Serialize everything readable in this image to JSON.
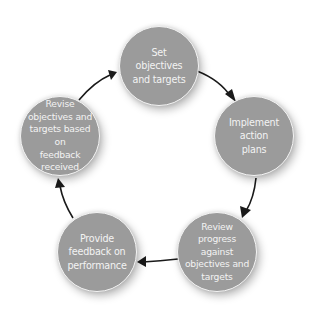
{
  "diagram": {
    "type": "cycle",
    "colors": {
      "node_fill": "#9b9b9b",
      "node_border": "#f4f4f4",
      "node_text": "#f3f3f3",
      "arrow": "#1a1a1a",
      "background": "#ffffff"
    },
    "nodes": [
      {
        "id": "set",
        "label": "Set\nobjectives\nand targets"
      },
      {
        "id": "implement",
        "label": "Implement\naction\nplans"
      },
      {
        "id": "review",
        "label": "Review\nprogress\nagainst\nobjectives and\ntargets"
      },
      {
        "id": "feedback",
        "label": "Provide\nfeedback on\nperformance"
      },
      {
        "id": "revise",
        "label": "Revise\nobjectives and\ntargets based on\nfeedback\nreceived"
      }
    ],
    "edges": [
      {
        "from": "set",
        "to": "implement"
      },
      {
        "from": "implement",
        "to": "review"
      },
      {
        "from": "review",
        "to": "feedback"
      },
      {
        "from": "feedback",
        "to": "revise"
      },
      {
        "from": "revise",
        "to": "set"
      }
    ]
  }
}
